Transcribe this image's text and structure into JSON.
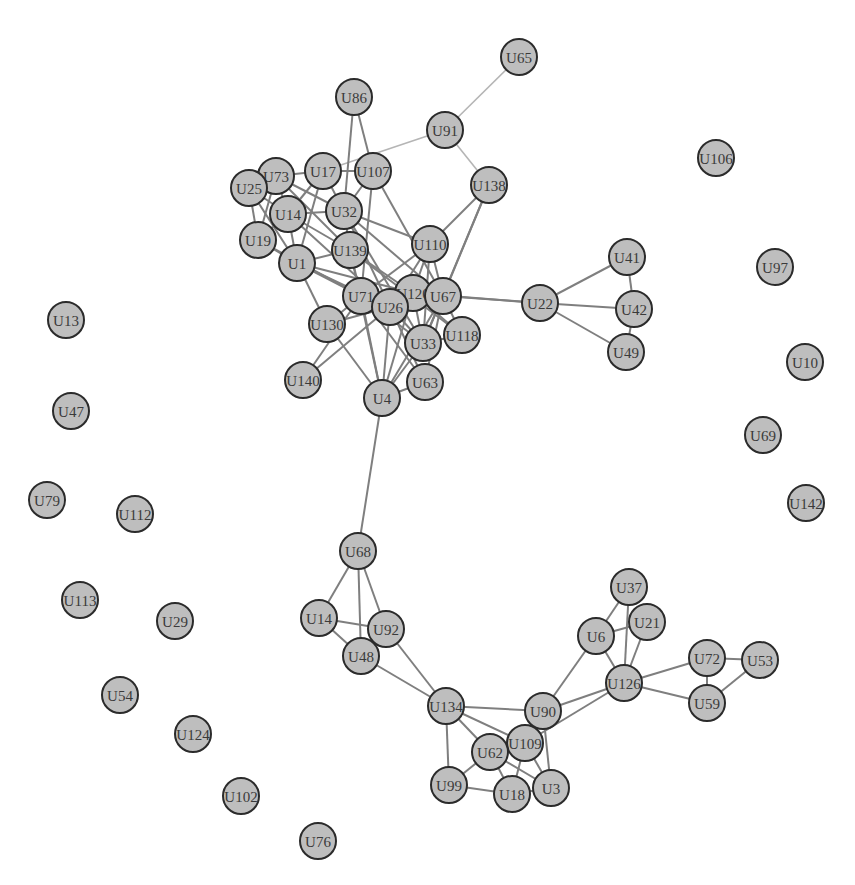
{
  "graph": {
    "type": "network",
    "style": {
      "background": "#ffffff",
      "node_fill": "#bebebe",
      "node_stroke": "#2b2b2b",
      "edge_color": "#7f7f7f",
      "node_radius": 18
    },
    "nodes": [
      {
        "id": "U65",
        "x": 519,
        "y": 57
      },
      {
        "id": "U86",
        "x": 354,
        "y": 97
      },
      {
        "id": "U91",
        "x": 445,
        "y": 130
      },
      {
        "id": "U106",
        "x": 716,
        "y": 158
      },
      {
        "id": "U73",
        "x": 276,
        "y": 176
      },
      {
        "id": "U17",
        "x": 323,
        "y": 171
      },
      {
        "id": "U107",
        "x": 373,
        "y": 171
      },
      {
        "id": "U25",
        "x": 249,
        "y": 188
      },
      {
        "id": "U138",
        "x": 489,
        "y": 185
      },
      {
        "id": "U14",
        "x": 288,
        "y": 214
      },
      {
        "id": "U32",
        "x": 344,
        "y": 211
      },
      {
        "id": "U19",
        "x": 258,
        "y": 240
      },
      {
        "id": "U110",
        "x": 430,
        "y": 244
      },
      {
        "id": "U139",
        "x": 350,
        "y": 250
      },
      {
        "id": "U1",
        "x": 297,
        "y": 263
      },
      {
        "id": "U41",
        "x": 627,
        "y": 257
      },
      {
        "id": "U97",
        "x": 775,
        "y": 267
      },
      {
        "id": "U71",
        "x": 361,
        "y": 296
      },
      {
        "id": "U120",
        "x": 413,
        "y": 293
      },
      {
        "id": "U67",
        "x": 443,
        "y": 296
      },
      {
        "id": "U26",
        "x": 390,
        "y": 307
      },
      {
        "id": "U22",
        "x": 540,
        "y": 303
      },
      {
        "id": "U42",
        "x": 634,
        "y": 309
      },
      {
        "id": "U13",
        "x": 66,
        "y": 320
      },
      {
        "id": "U130",
        "x": 327,
        "y": 324
      },
      {
        "id": "U118",
        "x": 462,
        "y": 335
      },
      {
        "id": "U33",
        "x": 423,
        "y": 343
      },
      {
        "id": "U49",
        "x": 626,
        "y": 352
      },
      {
        "id": "U10",
        "x": 805,
        "y": 362
      },
      {
        "id": "U140",
        "x": 303,
        "y": 380
      },
      {
        "id": "U63",
        "x": 425,
        "y": 382
      },
      {
        "id": "U4",
        "x": 382,
        "y": 398
      },
      {
        "id": "U47",
        "x": 71,
        "y": 411
      },
      {
        "id": "U69",
        "x": 763,
        "y": 435
      },
      {
        "id": "U79",
        "x": 47,
        "y": 500
      },
      {
        "id": "U142",
        "x": 806,
        "y": 503
      },
      {
        "id": "U112",
        "x": 135,
        "y": 514
      },
      {
        "id": "U68",
        "x": 358,
        "y": 551
      },
      {
        "id": "U113",
        "x": 80,
        "y": 600
      },
      {
        "id": "U37",
        "x": 629,
        "y": 587
      },
      {
        "id": "U14",
        "x": 319,
        "y": 618
      },
      {
        "id": "U29",
        "x": 175,
        "y": 621
      },
      {
        "id": "U21",
        "x": 647,
        "y": 622
      },
      {
        "id": "U92",
        "x": 386,
        "y": 629
      },
      {
        "id": "U6",
        "x": 596,
        "y": 636
      },
      {
        "id": "U48",
        "x": 361,
        "y": 656
      },
      {
        "id": "U72",
        "x": 707,
        "y": 658
      },
      {
        "id": "U53",
        "x": 760,
        "y": 660
      },
      {
        "id": "U126",
        "x": 624,
        "y": 683
      },
      {
        "id": "U54",
        "x": 120,
        "y": 695
      },
      {
        "id": "U59",
        "x": 707,
        "y": 703
      },
      {
        "id": "U134",
        "x": 446,
        "y": 706
      },
      {
        "id": "U90",
        "x": 543,
        "y": 711
      },
      {
        "id": "U124",
        "x": 193,
        "y": 734
      },
      {
        "id": "U109",
        "x": 525,
        "y": 743
      },
      {
        "id": "U62",
        "x": 490,
        "y": 752
      },
      {
        "id": "U99",
        "x": 449,
        "y": 785
      },
      {
        "id": "U18",
        "x": 512,
        "y": 794
      },
      {
        "id": "U3",
        "x": 551,
        "y": 788
      },
      {
        "id": "U102",
        "x": 241,
        "y": 796
      },
      {
        "id": "U76",
        "x": 318,
        "y": 841
      }
    ],
    "edges": [
      [
        "U65",
        "U91",
        1
      ],
      [
        "U91",
        "U17",
        1
      ],
      [
        "U91",
        "U138",
        1
      ],
      [
        "U86",
        "U32",
        0
      ],
      [
        "U86",
        "U107",
        0
      ],
      [
        "U17",
        "U107",
        0
      ],
      [
        "U73",
        "U17",
        0
      ],
      [
        "U25",
        "U73",
        0
      ],
      [
        "U25",
        "U14",
        0
      ],
      [
        "U25",
        "U19",
        0
      ],
      [
        "U25",
        "U1",
        0
      ],
      [
        "U73",
        "U14",
        0
      ],
      [
        "U73",
        "U19",
        0
      ],
      [
        "U73",
        "U32",
        0
      ],
      [
        "U73",
        "U139",
        0
      ],
      [
        "U17",
        "U14",
        0
      ],
      [
        "U17",
        "U32",
        0
      ],
      [
        "U17",
        "U1",
        0
      ],
      [
        "U107",
        "U32",
        0
      ],
      [
        "U107",
        "U71",
        0
      ],
      [
        "U107",
        "U67",
        0
      ],
      [
        "U14",
        "U32",
        0
      ],
      [
        "U14",
        "U1",
        0
      ],
      [
        "U14",
        "U19",
        0
      ],
      [
        "U14",
        "U139",
        0
      ],
      [
        "U14",
        "U26",
        0
      ],
      [
        "U19",
        "U1",
        0
      ],
      [
        "U19",
        "U71",
        0
      ],
      [
        "U1",
        "U139",
        0
      ],
      [
        "U1",
        "U71",
        0
      ],
      [
        "U1",
        "U130",
        0
      ],
      [
        "U1",
        "U26",
        0
      ],
      [
        "U1",
        "U120",
        0
      ],
      [
        "U32",
        "U139",
        0
      ],
      [
        "U32",
        "U110",
        0
      ],
      [
        "U32",
        "U67",
        0
      ],
      [
        "U32",
        "U26",
        0
      ],
      [
        "U32",
        "U33",
        0
      ],
      [
        "U139",
        "U71",
        0
      ],
      [
        "U139",
        "U120",
        0
      ],
      [
        "U139",
        "U118",
        0
      ],
      [
        "U139",
        "U4",
        0
      ],
      [
        "U110",
        "U138",
        0
      ],
      [
        "U110",
        "U120",
        0
      ],
      [
        "U110",
        "U67",
        0
      ],
      [
        "U110",
        "U26",
        0
      ],
      [
        "U110",
        "U33",
        0
      ],
      [
        "U110",
        "U71",
        0
      ],
      [
        "U138",
        "U67",
        0
      ],
      [
        "U138",
        "U33",
        0
      ],
      [
        "U71",
        "U26",
        0
      ],
      [
        "U71",
        "U130",
        0
      ],
      [
        "U71",
        "U4",
        0
      ],
      [
        "U71",
        "U33",
        0
      ],
      [
        "U71",
        "U63",
        0
      ],
      [
        "U120",
        "U67",
        0
      ],
      [
        "U120",
        "U26",
        0
      ],
      [
        "U120",
        "U33",
        0
      ],
      [
        "U120",
        "U118",
        0
      ],
      [
        "U120",
        "U22",
        0
      ],
      [
        "U120",
        "U4",
        0
      ],
      [
        "U67",
        "U22",
        0
      ],
      [
        "U67",
        "U33",
        0
      ],
      [
        "U67",
        "U118",
        0
      ],
      [
        "U67",
        "U4",
        0
      ],
      [
        "U67",
        "U63",
        0
      ],
      [
        "U26",
        "U130",
        0
      ],
      [
        "U26",
        "U140",
        0
      ],
      [
        "U26",
        "U4",
        0
      ],
      [
        "U26",
        "U33",
        0
      ],
      [
        "U26",
        "U63",
        0
      ],
      [
        "U130",
        "U4",
        0
      ],
      [
        "U140",
        "U71",
        0
      ],
      [
        "U33",
        "U4",
        0
      ],
      [
        "U63",
        "U4",
        0
      ],
      [
        "U118",
        "U33",
        0
      ],
      [
        "U22",
        "U41",
        0
      ],
      [
        "U22",
        "U42",
        0
      ],
      [
        "U22",
        "U49",
        0
      ],
      [
        "U41",
        "U42",
        0
      ],
      [
        "U42",
        "U49",
        0
      ],
      [
        "U4",
        "U68",
        0
      ],
      [
        "U68",
        "U14b",
        0
      ],
      [
        "U68",
        "U48",
        0
      ],
      [
        "U68",
        "U92",
        0
      ],
      [
        "U14b",
        "U92",
        0
      ],
      [
        "U14b",
        "U48",
        0
      ],
      [
        "U48",
        "U134",
        0
      ],
      [
        "U92",
        "U134",
        0
      ],
      [
        "U134",
        "U90",
        0
      ],
      [
        "U134",
        "U99",
        0
      ],
      [
        "U134",
        "U62",
        0
      ],
      [
        "U134",
        "U109",
        0
      ],
      [
        "U90",
        "U6",
        0
      ],
      [
        "U90",
        "U126",
        0
      ],
      [
        "U90",
        "U109",
        0
      ],
      [
        "U90",
        "U3",
        0
      ],
      [
        "U109",
        "U126",
        0
      ],
      [
        "U109",
        "U62",
        0
      ],
      [
        "U109",
        "U18",
        0
      ],
      [
        "U109",
        "U3",
        0
      ],
      [
        "U62",
        "U99",
        0
      ],
      [
        "U62",
        "U18",
        0
      ],
      [
        "U62",
        "U3",
        0
      ],
      [
        "U99",
        "U18",
        0
      ],
      [
        "U18",
        "U3",
        0
      ],
      [
        "U6",
        "U37",
        0
      ],
      [
        "U6",
        "U21",
        0
      ],
      [
        "U6",
        "U126",
        0
      ],
      [
        "U37",
        "U126",
        0
      ],
      [
        "U21",
        "U126",
        0
      ],
      [
        "U126",
        "U72",
        0
      ],
      [
        "U126",
        "U59",
        0
      ],
      [
        "U72",
        "U53",
        0
      ],
      [
        "U72",
        "U59",
        0
      ],
      [
        "U59",
        "U53",
        0
      ]
    ]
  }
}
